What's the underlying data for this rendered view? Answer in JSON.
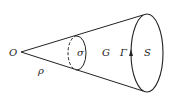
{
  "diagram": {
    "type": "cone-geometry",
    "labels": {
      "apex": "O",
      "generatrix": "ρ",
      "cross_section": "σ",
      "region": "G",
      "boundary_curve": "Γ",
      "base_surface": "S"
    },
    "colors": {
      "stroke": "#222222",
      "background": "#ffffff"
    }
  }
}
